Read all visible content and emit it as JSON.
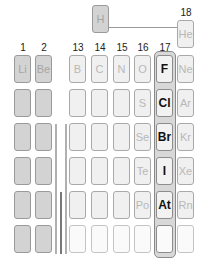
{
  "group_labels": {
    "g1": "1",
    "g2": "2",
    "g13": "13",
    "g14": "14",
    "g15": "15",
    "g16": "16",
    "g17": "17",
    "g18": "18"
  },
  "elements": {
    "H": "H",
    "He": "He",
    "Li": "Li",
    "Be": "Be",
    "B": "B",
    "C": "C",
    "N": "N",
    "O": "O",
    "F": "F",
    "Ne": "Ne",
    "S": "S",
    "Cl": "Cl",
    "Ar": "Ar",
    "Se": "Se",
    "Br": "Br",
    "Kr": "Kr",
    "Te": "Te",
    "I": "I",
    "Xe": "Xe",
    "Po": "Po",
    "At": "At",
    "Rn": "Rn"
  },
  "highlight": {
    "group": "17",
    "label": "Halogens",
    "elements": [
      "F",
      "Cl",
      "Br",
      "I",
      "At"
    ]
  },
  "colors": {
    "s_block": "#d3d3d3",
    "p_block": "#f0f0f0",
    "highlight_frame": "#8a8a8a"
  }
}
